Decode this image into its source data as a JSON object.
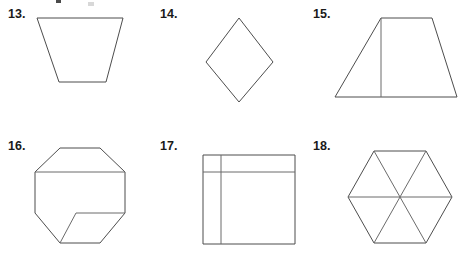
{
  "worksheet": {
    "background_color": "#ffffff",
    "stroke_color": "#4d4d4d",
    "inner_stroke_color": "#6b6b6b",
    "label_color": "#1a1a1a",
    "width": 467,
    "height": 254
  },
  "figures": [
    {
      "number": "13.",
      "label_x": 8,
      "label_y": 8,
      "shape_name": "trapezoid",
      "description": "Inverted trapezoid with long top side and shorter bottom side",
      "svg_x": 30,
      "svg_y": 12,
      "svg_w": 102,
      "svg_h": 80,
      "outline_points": "7,6 93,6 76,70 29,70",
      "inner_lines": []
    },
    {
      "number": "14.",
      "label_x": 160,
      "label_y": 8,
      "shape_name": "rhombus",
      "description": "Diamond shaped rhombus resting on a vertex",
      "svg_x": 200,
      "svg_y": 12,
      "svg_w": 78,
      "svg_h": 92,
      "outline_points": "39,6 73,50 39,93 6,50",
      "inner_lines": []
    },
    {
      "number": "15.",
      "label_x": 313,
      "label_y": 8,
      "shape_name": "trapezoid-with-segment",
      "description": "Trapezoid with short top side, long bottom side and an interior vertical segment",
      "svg_x": 330,
      "svg_y": 12,
      "svg_w": 130,
      "svg_h": 92,
      "outline_points": "51,6 102,6 127,85 5,85",
      "inner_lines": [
        "51,6 51,85"
      ]
    },
    {
      "number": "16.",
      "label_x": 8,
      "label_y": 140,
      "shape_name": "octagon-with-segments",
      "description": "Octagon containing an interior horizontal segment near the top and a horizontal plus diagonal segment near the bottom",
      "svg_x": 28,
      "svg_y": 140,
      "svg_w": 108,
      "svg_h": 112,
      "outline_points": "32,8 72,8 97,32 97,73 72,103 32,103 7,73 7,32",
      "inner_lines": [
        "7,32 97,32",
        "97,73 48,73",
        "48,73 32,103"
      ]
    },
    {
      "number": "17.",
      "label_x": 160,
      "label_y": 140,
      "shape_name": "square-with-segments",
      "description": "Square with an interior vertical segment near the left edge and an interior horizontal segment near the top edge",
      "svg_x": 195,
      "svg_y": 148,
      "svg_w": 110,
      "svg_h": 102,
      "outline_points": "8,7 100,7 100,96 8,96",
      "inner_lines": [
        "26,7 26,96",
        "8,24 100,24"
      ]
    },
    {
      "number": "18.",
      "label_x": 313,
      "label_y": 140,
      "shape_name": "hexagon-with-diagonals",
      "description": "Regular hexagon divided into six triangles by three long diagonals through the center",
      "svg_x": 342,
      "svg_y": 144,
      "svg_w": 118,
      "svg_h": 106,
      "outline_points": "32,7 84,7 110,53 84,99 32,99 6,53",
      "inner_lines": [
        "32,7 84,99",
        "84,7 32,99",
        "6,53 110,53"
      ]
    }
  ],
  "artifacts": {
    "top_mark_label": "cropped-mark",
    "top_mark_x": 56,
    "top_mark_y": 0,
    "top_mark_w": 5,
    "top_mark_h": 3,
    "faint_mark_x": 88,
    "faint_mark_y": 2,
    "faint_mark_w": 6,
    "faint_mark_h": 4
  }
}
